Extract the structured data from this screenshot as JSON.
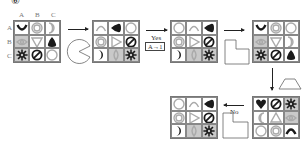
{
  "figure_number": "⑥",
  "column_labels": [
    "A",
    "B",
    "C"
  ],
  "row_labels": [
    "A",
    "B",
    "C"
  ],
  "transitions": {
    "yes_label": "Yes",
    "yes_rule": "A→1",
    "no_label": "No"
  },
  "colors": {
    "dark": "#1a1a1a",
    "light": "#aaaaaa",
    "gray_cell": "#c9c9c9",
    "border": "#888888"
  },
  "grids": [
    {
      "id": "grid-1",
      "cells": [
        {
          "shape": "cup",
          "tone": "dark",
          "bg": "white"
        },
        {
          "shape": "smiley",
          "tone": "light",
          "bg": "white"
        },
        {
          "shape": "crescent-right",
          "tone": "light",
          "bg": "white"
        },
        {
          "shape": "eye",
          "tone": "light",
          "bg": "gray"
        },
        {
          "shape": "triangle-down",
          "tone": "light",
          "bg": "white"
        },
        {
          "shape": "blob-up",
          "tone": "dark",
          "bg": "white"
        },
        {
          "shape": "sun",
          "tone": "dark",
          "bg": "gray"
        },
        {
          "shape": "no-sign",
          "tone": "dark",
          "bg": "white"
        },
        {
          "shape": "circle",
          "tone": "light",
          "bg": "white"
        }
      ]
    },
    {
      "id": "grid-2",
      "cells": [
        {
          "shape": "arc",
          "tone": "light",
          "bg": "white"
        },
        {
          "shape": "blob-left",
          "tone": "dark",
          "bg": "white"
        },
        {
          "shape": "circle",
          "tone": "light",
          "bg": "white"
        },
        {
          "shape": "smiley",
          "tone": "light",
          "bg": "white"
        },
        {
          "shape": "triangle-right",
          "tone": "light",
          "bg": "white"
        },
        {
          "shape": "no-sign",
          "tone": "dark",
          "bg": "white"
        },
        {
          "shape": "crescent-right",
          "tone": "dark",
          "bg": "white"
        },
        {
          "shape": "diamond-eye",
          "tone": "light",
          "bg": "gray"
        },
        {
          "shape": "sun",
          "tone": "dark",
          "bg": "gray"
        }
      ]
    },
    {
      "id": "grid-3",
      "cells": [
        {
          "shape": "circle",
          "tone": "light",
          "bg": "white"
        },
        {
          "shape": "arc",
          "tone": "light",
          "bg": "white"
        },
        {
          "shape": "blob-left",
          "tone": "dark",
          "bg": "white"
        },
        {
          "shape": "smiley",
          "tone": "light",
          "bg": "white"
        },
        {
          "shape": "triangle-right",
          "tone": "light",
          "bg": "white"
        },
        {
          "shape": "no-sign",
          "tone": "dark",
          "bg": "white"
        },
        {
          "shape": "crescent-right",
          "tone": "dark",
          "bg": "white"
        },
        {
          "shape": "diamond-eye",
          "tone": "light",
          "bg": "gray"
        },
        {
          "shape": "sun",
          "tone": "dark",
          "bg": "gray"
        }
      ]
    },
    {
      "id": "grid-4",
      "cells": [
        {
          "shape": "cup",
          "tone": "dark",
          "bg": "white"
        },
        {
          "shape": "smiley",
          "tone": "light",
          "bg": "white"
        },
        {
          "shape": "circle",
          "tone": "light",
          "bg": "white"
        },
        {
          "shape": "eye",
          "tone": "light",
          "bg": "gray"
        },
        {
          "shape": "triangle-down",
          "tone": "light",
          "bg": "white"
        },
        {
          "shape": "crescent-right",
          "tone": "light",
          "bg": "white"
        },
        {
          "shape": "sun",
          "tone": "dark",
          "bg": "gray"
        },
        {
          "shape": "no-sign",
          "tone": "dark",
          "bg": "white"
        },
        {
          "shape": "blob-up",
          "tone": "dark",
          "bg": "white"
        }
      ]
    },
    {
      "id": "grid-5",
      "cells": [
        {
          "shape": "heart",
          "tone": "dark",
          "bg": "white"
        },
        {
          "shape": "no-sign",
          "tone": "dark",
          "bg": "white"
        },
        {
          "shape": "sun",
          "tone": "dark",
          "bg": "gray"
        },
        {
          "shape": "crescent-left",
          "tone": "light",
          "bg": "white"
        },
        {
          "shape": "triangle-up",
          "tone": "light",
          "bg": "white"
        },
        {
          "shape": "eye",
          "tone": "light",
          "bg": "gray"
        },
        {
          "shape": "circle",
          "tone": "light",
          "bg": "white"
        },
        {
          "shape": "smiley",
          "tone": "light",
          "bg": "white"
        },
        {
          "shape": "arc",
          "tone": "dark",
          "bg": "white"
        }
      ]
    },
    {
      "id": "grid-6",
      "cells": [
        {
          "shape": "circle",
          "tone": "light",
          "bg": "white"
        },
        {
          "shape": "arc",
          "tone": "light",
          "bg": "white"
        },
        {
          "shape": "blob-left",
          "tone": "dark",
          "bg": "white"
        },
        {
          "shape": "smiley",
          "tone": "light",
          "bg": "white"
        },
        {
          "shape": "triangle-right",
          "tone": "light",
          "bg": "white"
        },
        {
          "shape": "no-sign",
          "tone": "dark",
          "bg": "white"
        },
        {
          "shape": "crescent-right",
          "tone": "dark",
          "bg": "white"
        },
        {
          "shape": "diamond-eye",
          "tone": "light",
          "bg": "gray"
        },
        {
          "shape": "sun",
          "tone": "dark",
          "bg": "gray"
        }
      ]
    }
  ],
  "operation_shapes": [
    {
      "id": "pacman",
      "label": "pacman-shape"
    },
    {
      "id": "l-shape-top",
      "label": "l-shape"
    },
    {
      "id": "trapezoid",
      "label": "trapezoid-shape"
    },
    {
      "id": "l-shape-bottom",
      "label": "l-shape"
    }
  ]
}
